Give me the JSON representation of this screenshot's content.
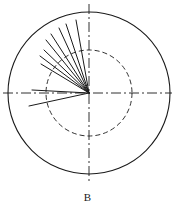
{
  "figure": {
    "caption": "B",
    "caption_position": {
      "x": 88,
      "y": 192
    },
    "canvas": {
      "width": 175,
      "height": 209,
      "background": "#ffffff"
    },
    "colors": {
      "stroke": "#1a1a1a",
      "axis": "#1a1a1a",
      "inner_circle": "#1a1a1a",
      "radial_line": "#1a1a1a",
      "background": "#ffffff"
    }
  },
  "chart_data": {
    "type": "scatter",
    "title": "B",
    "subtitle": "",
    "xlabel": "",
    "ylabel": "",
    "projection": "polar",
    "grid": false,
    "legend": null,
    "center": {
      "x": 89,
      "y": 93
    },
    "outer_circle": {
      "label": "outer boundary circle",
      "radius": 81,
      "radius_normalized": 1.0,
      "style": "solid",
      "stroke_width": 1.1
    },
    "inner_circle": {
      "label": "inner reference circle",
      "radius": 43,
      "radius_normalized": 0.53,
      "style": "dashed",
      "dash_pattern": "5,3",
      "stroke_width": 0.9
    },
    "axes": [
      {
        "name": "horizontal-axis",
        "orientation": "horizontal",
        "angle_deg": 0,
        "style": "dash-dot",
        "dash_pattern": "10,3,2,3",
        "x1": 3,
        "y1": 93,
        "x2": 172,
        "y2": 93
      },
      {
        "name": "vertical-axis",
        "orientation": "vertical",
        "angle_deg": 90,
        "style": "dash-dot",
        "dash_pattern": "10,3,2,3",
        "x1": 89,
        "y1": 4,
        "x2": 89,
        "y2": 181
      }
    ],
    "angle_unit": "degrees",
    "angle_reference": "counter-clockwise from positive x-axis",
    "radius_unit": "pixels from center",
    "series": [
      {
        "name": "radial vectors",
        "style": "solid",
        "stroke_width": 1.0,
        "count": 10,
        "values": [
          {
            "id": 1,
            "angle_deg": 192,
            "radius": 61,
            "x2": 29,
            "y2": 106
          },
          {
            "id": 2,
            "angle_deg": 177,
            "radius": 57,
            "x2": 32,
            "y2": 90
          },
          {
            "id": 3,
            "angle_deg": 149,
            "radius": 56,
            "x2": 41,
            "y2": 64
          },
          {
            "id": 4,
            "angle_deg": 143,
            "radius": 61,
            "x2": 40,
            "y2": 56
          },
          {
            "id": 5,
            "angle_deg": 136,
            "radius": 62,
            "x2": 44,
            "y2": 50
          },
          {
            "id": 6,
            "angle_deg": 129,
            "radius": 68,
            "x2": 46,
            "y2": 40
          },
          {
            "id": 7,
            "angle_deg": 123,
            "radius": 70,
            "x2": 51,
            "y2": 34
          },
          {
            "id": 8,
            "angle_deg": 115,
            "radius": 72,
            "x2": 59,
            "y2": 28
          },
          {
            "id": 9,
            "angle_deg": 108,
            "radius": 73,
            "x2": 66,
            "y2": 24
          },
          {
            "id": 10,
            "angle_deg": 100,
            "radius": 74,
            "x2": 76,
            "y2": 20
          }
        ]
      }
    ]
  }
}
